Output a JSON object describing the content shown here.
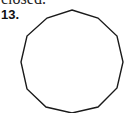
{
  "context_text": "closed.",
  "problem": {
    "number": "13.",
    "figure": {
      "shape": "regular-dodecagon",
      "sides": 12,
      "stroke_color": "#1a1a1a",
      "fill_color": "#ffffff",
      "vertices": [
        [
          72,
          10
        ],
        [
          98,
          18
        ],
        [
          117,
          36
        ],
        [
          123,
          62
        ],
        [
          117,
          88
        ],
        [
          98,
          107
        ],
        [
          72,
          113
        ],
        [
          46,
          107
        ],
        [
          27,
          89
        ],
        [
          21,
          62
        ],
        [
          27,
          36
        ],
        [
          47,
          18
        ]
      ]
    }
  }
}
